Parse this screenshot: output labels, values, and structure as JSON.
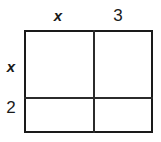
{
  "figure": {
    "name": "area-model-rectangle",
    "colors": {
      "outline": "#1a1a1a",
      "divider": "#2b2b2b",
      "fill": "#ffffff",
      "background": "#ffffff",
      "text": "#1a1a1a"
    }
  },
  "labels": {
    "top": [
      {
        "text": "x",
        "style": "italic-variable"
      },
      {
        "text": "3",
        "style": "upright-number"
      }
    ],
    "left": [
      {
        "text": "x",
        "style": "italic-variable"
      },
      {
        "text": "2",
        "style": "upright-number"
      }
    ]
  },
  "cells": [
    {
      "row": 0,
      "col": 0,
      "text": ""
    },
    {
      "row": 0,
      "col": 1,
      "text": ""
    },
    {
      "row": 1,
      "col": 0,
      "text": ""
    },
    {
      "row": 1,
      "col": 1,
      "text": ""
    }
  ]
}
